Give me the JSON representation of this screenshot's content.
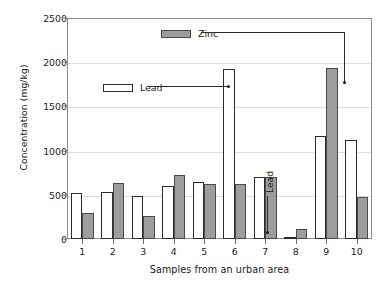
{
  "chart_data": {
    "type": "bar",
    "title": "",
    "xlabel": "Samples from an urban area",
    "ylabel": "Concentration (mg/kg)",
    "categories": [
      "1",
      "2",
      "3",
      "4",
      "5",
      "6",
      "7",
      "8",
      "9",
      "10"
    ],
    "ylim": [
      0,
      2500
    ],
    "yticks": [
      0,
      500,
      1000,
      1500,
      2000,
      2500
    ],
    "ytick_labels": [
      "0",
      "500",
      "1000",
      "1500",
      "2000",
      "2500"
    ],
    "grid": true,
    "legend_position": "inside-upper-left",
    "series": [
      {
        "name": "Lead",
        "color": "#ffffff",
        "edge_color": "#2b2b2b",
        "values": [
          520,
          530,
          490,
          600,
          640,
          1920,
          700,
          10,
          1160,
          1120
        ]
      },
      {
        "name": "Zinc",
        "color": "#9d9d9d",
        "edge_color": "#4a4a4a",
        "values": [
          290,
          630,
          260,
          720,
          620,
          620,
          700,
          110,
          1940,
          470
        ]
      }
    ],
    "annotations": [
      {
        "label": "Zinc",
        "points_to_category": "9",
        "points_to_series": "Zinc",
        "points_to_value": 1940
      },
      {
        "label": "Lead",
        "points_to_category": "6",
        "points_to_series": "Lead",
        "points_to_value": 1920
      },
      {
        "label": "Lead",
        "points_to_category": "8",
        "points_to_series": "Lead",
        "points_to_value": 10
      }
    ]
  }
}
